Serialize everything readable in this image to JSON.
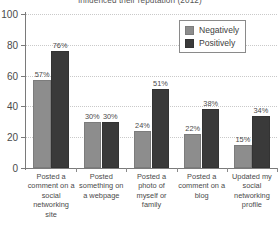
{
  "chart_data": {
    "type": "bar",
    "title": "influenced their reputation (2012)",
    "xlabel": "",
    "ylabel": "",
    "ylim": [
      0,
      100
    ],
    "yticks": [
      0,
      20,
      40,
      60,
      80,
      100
    ],
    "grid": true,
    "legend_position": "top-right",
    "categories": [
      "Posted a comment on a social networking site",
      "Posted something on a webpage",
      "Posted a photo of myself or family",
      "Posted a comment on a blog",
      "Updated my social networking profile"
    ],
    "series": [
      {
        "name": "Negatively",
        "color": "#8d8d8d",
        "values": [
          57,
          30,
          24,
          22,
          15
        ],
        "labels": [
          "57%",
          "30%",
          "24%",
          "22%",
          "15%"
        ]
      },
      {
        "name": "Positively",
        "color": "#3a3a3a",
        "values": [
          76,
          30,
          51,
          38,
          34
        ],
        "labels": [
          "76%",
          "30%",
          "51%",
          "38%",
          "34%"
        ]
      }
    ]
  },
  "axis": {
    "tick_labels": [
      "0",
      "20",
      "40",
      "60",
      "80",
      "100"
    ]
  },
  "legend": {
    "entries": [
      {
        "label": "Negatively"
      },
      {
        "label": "Positively"
      }
    ]
  }
}
